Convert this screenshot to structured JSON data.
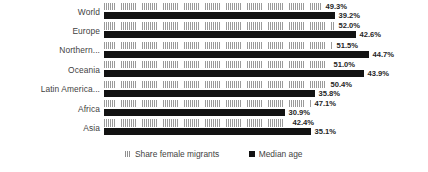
{
  "chart_data": {
    "type": "bar",
    "orientation": "horizontal",
    "title": "",
    "xlabel": "",
    "ylabel": "",
    "grid": false,
    "legend_position": "bottom",
    "categories": [
      "World",
      "Europe",
      "Northern...",
      "Oceania",
      "Latin America...",
      "Africa",
      "Asia"
    ],
    "series": [
      {
        "name": "Share female migrants",
        "color": "#d6d6d6",
        "pattern": "vertical-hatch",
        "values": [
          49.3,
          52.0,
          51.5,
          51.0,
          50.4,
          47.1,
          42.4
        ],
        "labels": [
          "49.3%",
          "52.0%",
          "51.5%",
          "51.0%",
          "50.4%",
          "47.1%",
          "42.4%"
        ],
        "bar_pixel_widths": [
          218,
          231,
          229,
          226,
          223,
          207,
          185
        ]
      },
      {
        "name": "Median age",
        "color": "#121212",
        "pattern": "solid",
        "values": [
          39.2,
          42.6,
          44.7,
          43.9,
          35.8,
          30.9,
          35.1
        ],
        "labels": [
          "39.2%",
          "42.6%",
          "44.7%",
          "43.9%",
          "35.8%",
          "30.9%",
          "35.1%"
        ],
        "bar_pixel_widths": [
          231,
          252,
          265,
          260,
          211,
          181,
          207
        ]
      }
    ]
  },
  "legend": {
    "items": [
      {
        "label": "Share female migrants",
        "swatch": "share"
      },
      {
        "label": "Median age",
        "swatch": "median"
      }
    ]
  }
}
